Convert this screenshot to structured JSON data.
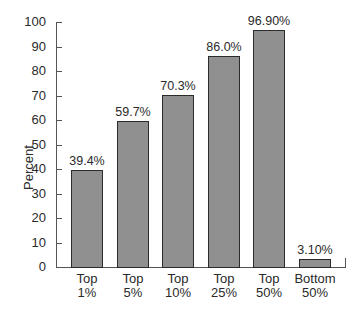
{
  "chart_data": {
    "type": "bar",
    "title": "",
    "xlabel": "",
    "ylabel": "Percent",
    "ylim": [
      0,
      100
    ],
    "yticks": [
      0,
      10,
      20,
      30,
      40,
      50,
      60,
      70,
      80,
      90,
      100
    ],
    "grid": false,
    "categories": [
      "Top 1%",
      "Top 5%",
      "Top 10%",
      "Top 25%",
      "Top 50%",
      "Bottom 50%"
    ],
    "category_lines": [
      [
        "Top",
        "1%"
      ],
      [
        "Top",
        "5%"
      ],
      [
        "Top",
        "10%"
      ],
      [
        "Top",
        "25%"
      ],
      [
        "Top",
        "50%"
      ],
      [
        "Bottom",
        "50%"
      ]
    ],
    "values": [
      39.4,
      59.7,
      70.3,
      86.0,
      96.9,
      3.1
    ],
    "value_labels": [
      "39.4%",
      "59.7%",
      "70.3%",
      "86.0%",
      "96.90%",
      "3.10%"
    ],
    "bar_color": "#909090",
    "bar_edge_color": "#2b2b2b"
  }
}
